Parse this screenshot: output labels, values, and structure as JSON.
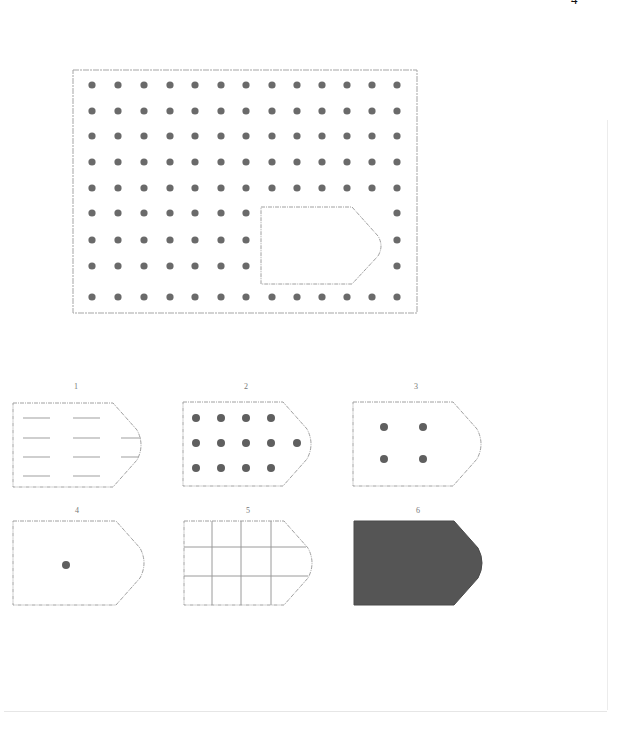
{
  "page": {
    "page_number": "4"
  },
  "puzzle": {
    "matrix": {
      "box": {
        "x": 73,
        "y": 70,
        "w": 344,
        "h": 243
      },
      "dot_columns": [
        92,
        118,
        144,
        170,
        195,
        221,
        246,
        272,
        297,
        322,
        347,
        372,
        397
      ],
      "dot_rows": [
        85,
        111,
        136,
        162,
        188,
        213,
        240,
        266,
        297
      ],
      "dot_color": "#6a6a6a",
      "missing_piece": {
        "x": 261,
        "y": 207,
        "w": 121,
        "h": 77,
        "notch_start_x": 352
      }
    },
    "options": [
      {
        "label": "1",
        "pattern": "dashes",
        "box": {
          "x": 13,
          "y": 403,
          "w": 130,
          "h": 84
        }
      },
      {
        "label": "2",
        "pattern": "dense-dots",
        "box": {
          "x": 183,
          "y": 402,
          "w": 130,
          "h": 84
        }
      },
      {
        "label": "3",
        "pattern": "four-dots",
        "box": {
          "x": 353,
          "y": 402,
          "w": 130,
          "h": 84
        }
      },
      {
        "label": "4",
        "pattern": "single-dot",
        "box": {
          "x": 13,
          "y": 521,
          "w": 133,
          "h": 84
        }
      },
      {
        "label": "5",
        "pattern": "grid-lines",
        "box": {
          "x": 184,
          "y": 521,
          "w": 130,
          "h": 84
        }
      },
      {
        "label": "6",
        "pattern": "solid-fill",
        "box": {
          "x": 354,
          "y": 521,
          "w": 130,
          "h": 84
        }
      }
    ],
    "colors": {
      "outline": "#9a9a9a",
      "dot": "#6a6a6a",
      "solid": "#555555"
    }
  }
}
